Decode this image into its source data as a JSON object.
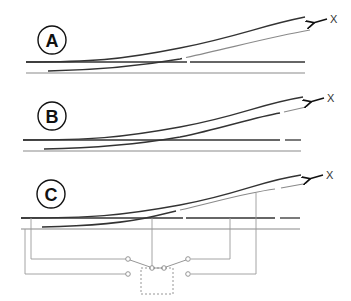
{
  "diagram": {
    "panels": [
      {
        "id": "A",
        "label": "A",
        "marker": "X"
      },
      {
        "id": "B",
        "label": "B",
        "marker": "X"
      },
      {
        "id": "C",
        "label": "C",
        "marker": "X"
      }
    ],
    "colors": {
      "rail_dark": "#333333",
      "rail_light": "#8a8a8a",
      "wire": "#9a9a9a",
      "label_circle": "#111111",
      "switch_box": "#888888"
    }
  }
}
